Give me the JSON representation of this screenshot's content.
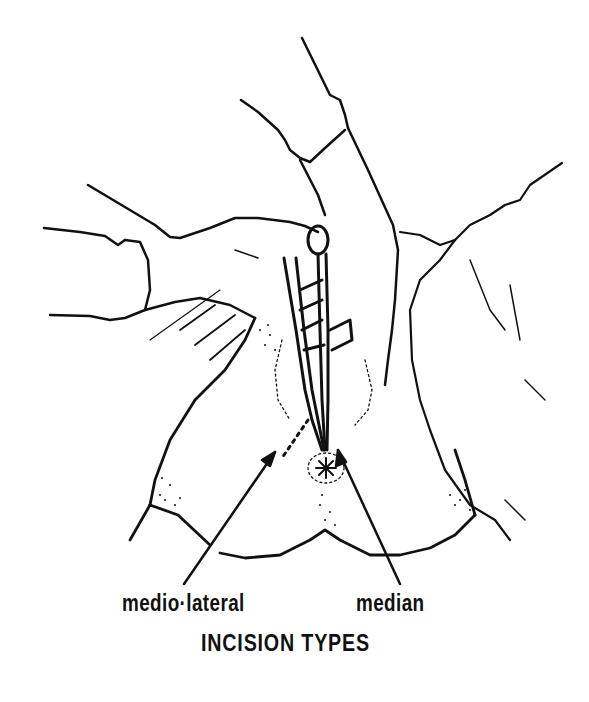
{
  "figure": {
    "labels": {
      "mediolateral": "medio·lateral",
      "median": "median"
    },
    "caption": "INCISION TYPES",
    "colors": {
      "ink": "#111111",
      "background": "#ffffff"
    }
  }
}
